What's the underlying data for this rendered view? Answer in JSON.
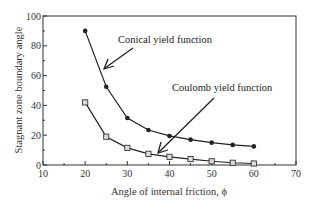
{
  "chart_data": {
    "type": "line",
    "title": "",
    "xlabel": "Angle of internal friction, ϕ",
    "ylabel": "Stagnant zone boundary angle",
    "xlim": [
      10,
      70
    ],
    "ylim": [
      0,
      100
    ],
    "xticks": [
      10,
      20,
      30,
      40,
      50,
      60,
      70
    ],
    "yticks": [
      0,
      20,
      40,
      60,
      80,
      100
    ],
    "grid": false,
    "legend": "none (annotations with arrows)",
    "x": [
      20,
      25,
      30,
      35,
      40,
      45,
      50,
      55,
      60
    ],
    "series": [
      {
        "name": "Conical yield function",
        "marker": "filled-circle",
        "values": [
          90,
          52.5,
          31.5,
          23.5,
          19.5,
          17,
          15,
          13.5,
          12.5
        ]
      },
      {
        "name": "Coulomb yield function",
        "marker": "open-square",
        "values": [
          42,
          19,
          11.5,
          7.5,
          5.5,
          4,
          2.5,
          1.5,
          1
        ]
      }
    ],
    "annotations": [
      {
        "text": "Conical yield function",
        "arrow_to": [
          24,
          66
        ]
      },
      {
        "text": "Coulomb yield function",
        "arrow_to": [
          37,
          9
        ]
      }
    ]
  },
  "labels": {
    "xlabel": "Angle of internal friction, ϕ",
    "ylabel": "Stagnant zone boundary angle",
    "annot_conical": "Conical yield function",
    "annot_coulomb": "Coulomb yield function",
    "xticks": [
      "10",
      "20",
      "30",
      "40",
      "50",
      "60",
      "70"
    ],
    "yticks": [
      "0",
      "20",
      "40",
      "60",
      "80",
      "100"
    ]
  }
}
